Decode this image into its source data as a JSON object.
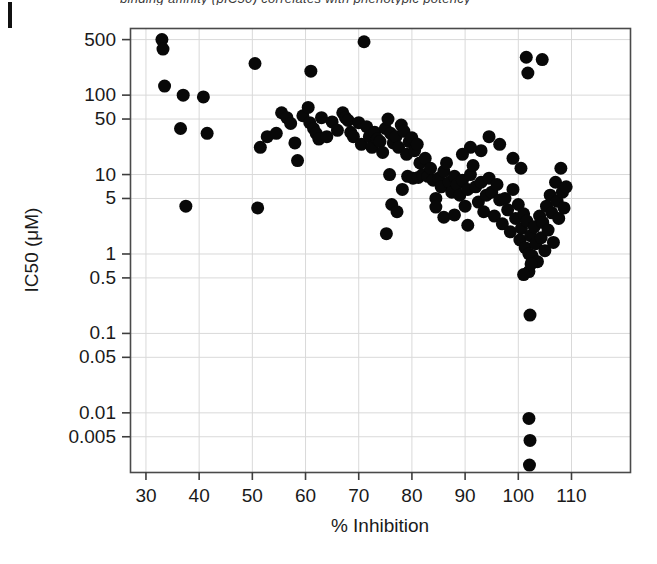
{
  "page": {
    "cut_header_text": "binding affinity (pIC50) correlates with phenotypic potency",
    "background_color": "#ffffff"
  },
  "chart_data": {
    "type": "scatter",
    "title": "",
    "xlabel": "% Inhibition",
    "ylabel": "IC50 (μM)",
    "xlim": [
      27,
      121
    ],
    "ylim": [
      0.0018,
      700
    ],
    "yscale": "log",
    "xscale": "linear",
    "grid": true,
    "legend": null,
    "marker": {
      "shape": "circle",
      "color": "#080808",
      "size_px": 13
    },
    "xticks": [
      30,
      40,
      50,
      60,
      70,
      80,
      90,
      100,
      110
    ],
    "xticklabels": [
      "30",
      "40",
      "50",
      "60",
      "70",
      "80",
      "90",
      "100",
      "110"
    ],
    "yticks": [
      500,
      100,
      50,
      10,
      5,
      1,
      0.5,
      0.1,
      0.05,
      0.01,
      0.005
    ],
    "yticklabels": [
      "500",
      "100",
      "50",
      "10",
      "5",
      "1",
      "0.5",
      "0.1",
      "0.05",
      "0.01",
      "0.005"
    ],
    "n_points": 148,
    "points": [
      [
        33.0,
        500
      ],
      [
        33.2,
        380
      ],
      [
        33.5,
        130
      ],
      [
        37.0,
        100
      ],
      [
        36.5,
        38
      ],
      [
        37.5,
        4.0
      ],
      [
        40.8,
        95
      ],
      [
        41.5,
        33
      ],
      [
        50.5,
        250
      ],
      [
        51.5,
        22
      ],
      [
        51.0,
        3.8
      ],
      [
        52.8,
        30
      ],
      [
        54.5,
        33
      ],
      [
        55.5,
        60
      ],
      [
        56.5,
        52
      ],
      [
        57.2,
        44
      ],
      [
        58.0,
        25
      ],
      [
        58.5,
        15
      ],
      [
        59.5,
        55
      ],
      [
        60.5,
        70
      ],
      [
        60.8,
        45
      ],
      [
        61.0,
        200
      ],
      [
        61.5,
        38
      ],
      [
        62.0,
        33
      ],
      [
        62.5,
        28
      ],
      [
        63.0,
        52
      ],
      [
        64.0,
        30
      ],
      [
        65.0,
        46
      ],
      [
        66.0,
        36
      ],
      [
        67.0,
        60
      ],
      [
        67.5,
        52
      ],
      [
        68.0,
        48
      ],
      [
        68.5,
        34
      ],
      [
        69.0,
        30
      ],
      [
        70.0,
        45
      ],
      [
        70.5,
        24
      ],
      [
        71.0,
        470
      ],
      [
        71.5,
        40
      ],
      [
        72.0,
        30
      ],
      [
        72.5,
        22
      ],
      [
        73.0,
        34
      ],
      [
        73.5,
        28
      ],
      [
        74.0,
        26
      ],
      [
        74.5,
        19
      ],
      [
        75.0,
        38
      ],
      [
        75.5,
        50
      ],
      [
        75.8,
        10
      ],
      [
        76.0,
        33
      ],
      [
        76.5,
        25
      ],
      [
        77.0,
        30
      ],
      [
        77.5,
        22
      ],
      [
        78.0,
        42
      ],
      [
        78.5,
        35
      ],
      [
        79.0,
        18
      ],
      [
        79.5,
        26
      ],
      [
        80.0,
        29
      ],
      [
        80.5,
        20
      ],
      [
        81.0,
        24
      ],
      [
        81.5,
        14
      ],
      [
        75.2,
        1.8
      ],
      [
        76.2,
        4.2
      ],
      [
        77.2,
        3.4
      ],
      [
        78.2,
        6.5
      ],
      [
        79.2,
        9.5
      ],
      [
        80.2,
        9.0
      ],
      [
        81.2,
        9.2
      ],
      [
        82.0,
        10
      ],
      [
        82.5,
        16
      ],
      [
        83.0,
        9.5
      ],
      [
        83.5,
        12
      ],
      [
        84.0,
        8.5
      ],
      [
        84.5,
        5.0
      ],
      [
        85.0,
        9.0
      ],
      [
        85.5,
        7.0
      ],
      [
        86.0,
        11
      ],
      [
        86.5,
        14
      ],
      [
        87.0,
        8.0
      ],
      [
        87.5,
        6.0
      ],
      [
        88.0,
        9.5
      ],
      [
        88.5,
        7.5
      ],
      [
        89.0,
        5.5
      ],
      [
        89.5,
        8.5
      ],
      [
        90.0,
        4.0
      ],
      [
        90.5,
        6.5
      ],
      [
        91.0,
        10
      ],
      [
        91.5,
        13
      ],
      [
        92.0,
        7.0
      ],
      [
        92.5,
        4.5
      ],
      [
        93.0,
        8.0
      ],
      [
        93.5,
        3.4
      ],
      [
        94.0,
        5.5
      ],
      [
        94.5,
        9.0
      ],
      [
        95.0,
        6.0
      ],
      [
        95.5,
        3.0
      ],
      [
        96.0,
        7.5
      ],
      [
        96.5,
        4.8
      ],
      [
        97.0,
        2.4
      ],
      [
        97.5,
        5.0
      ],
      [
        98.0,
        3.6
      ],
      [
        98.5,
        1.9
      ],
      [
        99.0,
        6.5
      ],
      [
        99.5,
        2.8
      ],
      [
        100.0,
        4.2
      ],
      [
        100.3,
        1.5
      ],
      [
        100.6,
        2.1
      ],
      [
        101.0,
        3.2
      ],
      [
        101.3,
        1.2
      ],
      [
        101.6,
        2.6
      ],
      [
        102.0,
        1.0
      ],
      [
        102.3,
        1.7
      ],
      [
        102.6,
        0.95
      ],
      [
        103.0,
        2.2
      ],
      [
        103.3,
        1.35
      ],
      [
        103.6,
        0.8
      ],
      [
        104.0,
        3.0
      ],
      [
        104.3,
        1.6
      ],
      [
        104.6,
        2.5
      ],
      [
        105.0,
        1.1
      ],
      [
        105.3,
        4.0
      ],
      [
        105.6,
        2.0
      ],
      [
        106.0,
        5.5
      ],
      [
        106.3,
        3.3
      ],
      [
        106.6,
        1.4
      ],
      [
        107.0,
        8.0
      ],
      [
        107.3,
        4.6
      ],
      [
        107.6,
        2.8
      ],
      [
        108.0,
        12
      ],
      [
        108.3,
        6.0
      ],
      [
        108.6,
        3.8
      ],
      [
        109.0,
        7.0
      ],
      [
        101.5,
        300
      ],
      [
        101.8,
        190
      ],
      [
        104.5,
        280
      ],
      [
        96.5,
        24
      ],
      [
        94.5,
        30
      ],
      [
        93.0,
        20
      ],
      [
        91.0,
        22
      ],
      [
        89.5,
        18
      ],
      [
        99.0,
        16
      ],
      [
        100.5,
        12
      ],
      [
        102.0,
        0.6
      ],
      [
        102.4,
        0.75
      ],
      [
        101.0,
        0.55
      ],
      [
        102.2,
        0.17
      ],
      [
        102.0,
        0.0085
      ],
      [
        102.2,
        0.0045
      ],
      [
        102.1,
        0.0022
      ],
      [
        86.0,
        2.9
      ],
      [
        88.0,
        3.1
      ],
      [
        90.5,
        2.3
      ],
      [
        84.5,
        3.9
      ]
    ]
  }
}
